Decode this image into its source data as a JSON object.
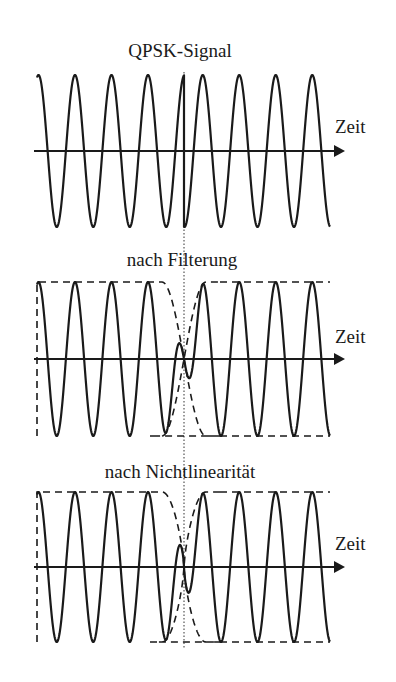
{
  "figure": {
    "panels": [
      {
        "title": "QPSK-Signal",
        "axis_label": "Zeit"
      },
      {
        "title": "nach Filterung",
        "axis_label": "Zeit"
      },
      {
        "title": "nach Nichtlinearität",
        "axis_label": "Zeit"
      }
    ]
  },
  "chart_data": {
    "type": "diagram",
    "x_start": 37,
    "x_end": 330,
    "phase_jump_x": 184,
    "period_px": 36.5,
    "first_peak_x": 75,
    "panels": [
      {
        "title": "QPSK-Signal",
        "axis_y": 151,
        "amplitude": 76,
        "envelope": "none",
        "xlabel": "Zeit"
      },
      {
        "title": "nach Filterung",
        "axis_y": 359,
        "amplitude": 77,
        "envelope": "dashed, pinches to zero at phase jump",
        "xlabel": "Zeit"
      },
      {
        "title": "nach Nichtlinearität",
        "axis_y": 567,
        "amplitude": 75,
        "envelope": "dashed, pinches to zero at phase jump",
        "xlabel": "Zeit"
      }
    ],
    "colors": {
      "ink": "#1a1a1a",
      "background": "#ffffff"
    }
  }
}
